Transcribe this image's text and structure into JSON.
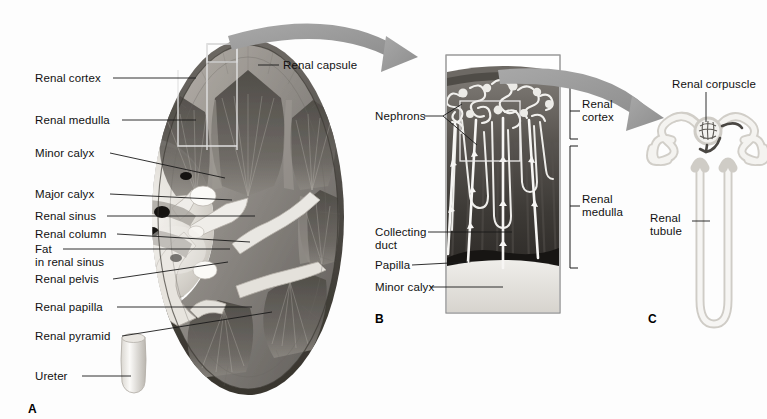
{
  "figure": {
    "background_color": "#fdfdfd",
    "line_color": "#1a1a1a",
    "arrow_color": "#9b9b9b",
    "callout_box_color": "#e8e8e8"
  },
  "panels": [
    {
      "id": "A",
      "letter": "A",
      "x": 28,
      "y": 408,
      "caption": "Coronal section of whole kidney"
    },
    {
      "id": "B",
      "letter": "B",
      "x": 375,
      "y": 320,
      "caption": "Enlarged wedge of cortex and medulla"
    },
    {
      "id": "C",
      "letter": "C",
      "x": 648,
      "y": 320,
      "caption": "Single nephron"
    }
  ],
  "panel_a": {
    "labels": [
      {
        "name": "renal-cortex",
        "text": "Renal cortex",
        "x": 35,
        "y": 72,
        "leader": {
          "x1": 113,
          "y1": 78,
          "x2": 196,
          "y2": 78
        }
      },
      {
        "name": "renal-medulla",
        "text": "Renal medulla",
        "x": 35,
        "y": 114,
        "leader": {
          "x1": 122,
          "y1": 120,
          "x2": 196,
          "y2": 120
        }
      },
      {
        "name": "minor-calyx",
        "text": "Minor calyx",
        "x": 35,
        "y": 147,
        "leader": {
          "x1": 110,
          "y1": 153,
          "x2": 225,
          "y2": 178
        }
      },
      {
        "name": "major-calyx",
        "text": "Major calyx",
        "x": 35,
        "y": 188,
        "leader": {
          "x1": 110,
          "y1": 194,
          "x2": 232,
          "y2": 200
        }
      },
      {
        "name": "renal-sinus",
        "text": "Renal sinus",
        "x": 35,
        "y": 210,
        "leader": {
          "x1": 107,
          "y1": 216,
          "x2": 255,
          "y2": 216
        }
      },
      {
        "name": "renal-column",
        "text": "Renal column",
        "x": 35,
        "y": 228,
        "leader": {
          "x1": 117,
          "y1": 234,
          "x2": 250,
          "y2": 242
        }
      },
      {
        "name": "fat-in-renal-sinus",
        "text": "Fat\nin renal sinus",
        "x": 35,
        "y": 243,
        "leader": {
          "x1": 63,
          "y1": 249,
          "x2": 230,
          "y2": 249
        }
      },
      {
        "name": "renal-pelvis",
        "text": "Renal pelvis",
        "x": 35,
        "y": 273,
        "leader": {
          "x1": 113,
          "y1": 279,
          "x2": 228,
          "y2": 262
        }
      },
      {
        "name": "renal-papilla",
        "text": "Renal papilla",
        "x": 35,
        "y": 301,
        "leader": {
          "x1": 117,
          "y1": 307,
          "x2": 252,
          "y2": 307
        }
      },
      {
        "name": "renal-pyramid",
        "text": "Renal pyramid",
        "x": 35,
        "y": 330,
        "leader": {
          "x1": 122,
          "y1": 336,
          "x2": 272,
          "y2": 312
        }
      },
      {
        "name": "ureter",
        "text": "Ureter",
        "x": 35,
        "y": 370,
        "leader": {
          "x1": 82,
          "y1": 376,
          "x2": 131,
          "y2": 376
        }
      },
      {
        "name": "renal-capsule",
        "text": "Renal capsule",
        "x": 283,
        "y": 59,
        "leader": {
          "x1": 258,
          "y1": 65,
          "x2": 279,
          "y2": 65
        }
      }
    ],
    "callout_box": {
      "x": 207,
      "y": 44,
      "width": 30,
      "height": 18
    }
  },
  "panel_b": {
    "frame": {
      "x": 446,
      "y": 55,
      "width": 114,
      "height": 258
    },
    "labels": [
      {
        "name": "nephrons",
        "text": "Nephrons",
        "x": 375,
        "y": 110,
        "align": "left"
      },
      {
        "name": "collecting-duct",
        "text": "Collecting\nduct",
        "x": 375,
        "y": 226,
        "align": "left"
      },
      {
        "name": "papilla",
        "text": "Papilla",
        "x": 375,
        "y": 259,
        "align": "left"
      },
      {
        "name": "minor-calyx-b",
        "text": "Minor calyx",
        "x": 375,
        "y": 281,
        "align": "left"
      }
    ],
    "brackets": [
      {
        "name": "renal-cortex-bracket",
        "text": "Renal\ncortex",
        "y_top": 84,
        "y_bottom": 139,
        "x": 572,
        "label_x": 582,
        "label_y": 104
      },
      {
        "name": "renal-medulla-bracket",
        "text": "Renal\nmedulla",
        "y_top": 146,
        "y_bottom": 268,
        "x": 572,
        "label_x": 582,
        "label_y": 198
      }
    ]
  },
  "panel_c": {
    "labels": [
      {
        "name": "renal-corpuscle",
        "text": "Renal corpuscle",
        "x": 675,
        "y": 80,
        "leader": {
          "x1": 706,
          "y1": 92,
          "x2": 706,
          "y2": 125
        }
      },
      {
        "name": "renal-tubule",
        "text": "Renal\ntubule",
        "x": 650,
        "y": 215,
        "leader": {
          "x1": 692,
          "y1": 221,
          "x2": 713,
          "y2": 221
        }
      }
    ]
  },
  "arrows": [
    {
      "name": "arrow-a-to-b",
      "from": {
        "x": 232,
        "y": 42
      },
      "to": {
        "x": 440,
        "y": 72
      }
    },
    {
      "name": "arrow-b-to-c",
      "from": {
        "x": 500,
        "y": 75
      },
      "to": {
        "x": 660,
        "y": 110
      }
    }
  ]
}
